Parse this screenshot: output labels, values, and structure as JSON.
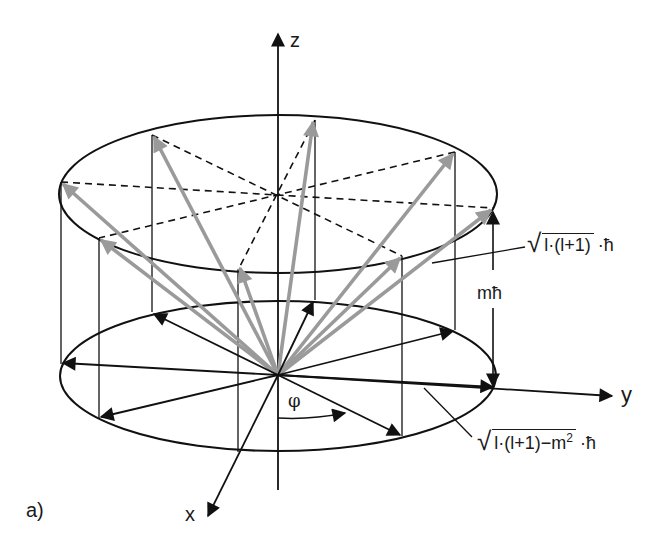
{
  "figure": {
    "panel_label": "a)",
    "axes": {
      "z_label": "z",
      "y_label": "y",
      "x_label": "x"
    },
    "angle_label": "φ",
    "height_label": "mħ",
    "formula_total": {
      "radicand": "l·(l+1)",
      "tail": "·ħ"
    },
    "formula_radius": {
      "radicand_pre": "l·(l+1)−m",
      "exponent": "2",
      "tail": "·ħ"
    },
    "colors": {
      "ink": "#111111",
      "gray_vector": "#9a9a9a",
      "background": "#ffffff"
    },
    "geometry": {
      "origin": [
        278,
        375
      ],
      "top_ellipse": {
        "cx": 278,
        "cy": 193,
        "rx": 218,
        "ry": 80
      },
      "bottom_ellipse": {
        "cx": 278,
        "cy": 375,
        "rx": 218,
        "ry": 76
      },
      "rim_points_top": [
        [
          61,
          182
        ],
        [
          152,
          135
        ],
        [
          315,
          120
        ],
        [
          455,
          152
        ],
        [
          493,
          208
        ],
        [
          402,
          256
        ],
        [
          238,
          270
        ],
        [
          99,
          238
        ]
      ],
      "rim_points_bottom": [
        [
          61,
          364
        ],
        [
          152,
          312
        ],
        [
          315,
          300
        ],
        [
          455,
          330
        ],
        [
          493,
          390
        ],
        [
          402,
          436
        ],
        [
          238,
          452
        ],
        [
          99,
          418
        ]
      ]
    }
  }
}
